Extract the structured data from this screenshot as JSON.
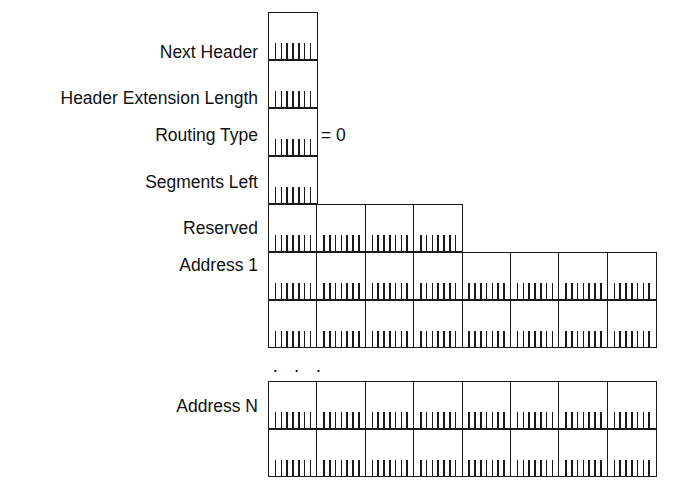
{
  "diagram": {
    "bits_per_byte": 8,
    "line_color": "#1a1a1a",
    "background_color": "#ffffff",
    "annotation": "= 0",
    "continuation_dots": "· · ·",
    "fields": [
      {
        "label": "Next Header",
        "bytes": 1,
        "rows": 1
      },
      {
        "label": "Header Extension Length",
        "bytes": 1,
        "rows": 1
      },
      {
        "label": "Routing Type",
        "bytes": 1,
        "rows": 1,
        "note": "= 0"
      },
      {
        "label": "Segments Left",
        "bytes": 1,
        "rows": 1
      },
      {
        "label": "Reserved",
        "bytes": 4,
        "rows": 1
      },
      {
        "label": "Address 1",
        "bytes": 8,
        "rows": 2
      },
      {
        "label": "Address N",
        "bytes": 8,
        "rows": 2
      }
    ],
    "labels": {
      "next_header": "Next Header",
      "header_extension_length": "Header Extension Length",
      "routing_type": "Routing Type",
      "segments_left": "Segments Left",
      "reserved": "Reserved",
      "address_1": "Address 1",
      "address_n": "Address N"
    }
  }
}
